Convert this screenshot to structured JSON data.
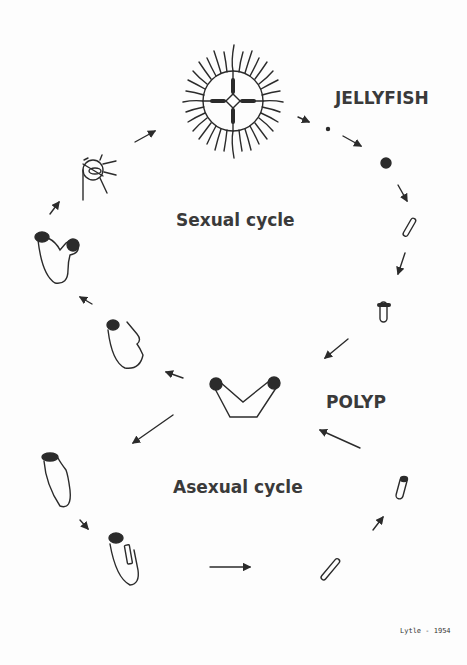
{
  "diagram": {
    "type": "life-cycle",
    "labels": {
      "jellyfish": "JELLYFISH",
      "sexual_cycle": "Sexual cycle",
      "polyp": "POLYP",
      "asexual_cycle": "Asexual cycle",
      "signature": "Lytle - 1954"
    },
    "colors": {
      "ink": "#2b2b2b",
      "text": "#3a3a3a",
      "background": "#fdfdfd"
    },
    "sexual_stages": [
      "jellyfish",
      "egg",
      "fertilized egg",
      "planula larva",
      "young polyp",
      "polyp",
      "budding polyp",
      "budding polyp with medusa bud",
      "ephyra"
    ],
    "asexual_stages": [
      "polyp",
      "polyp",
      "budding polyp",
      "planula-like bud",
      "young polyp"
    ]
  }
}
